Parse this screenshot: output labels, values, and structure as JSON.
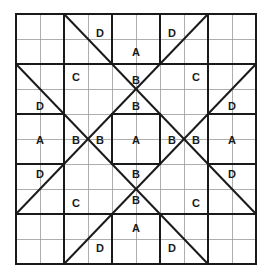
{
  "figure": {
    "name": "quilt-block-diagram",
    "background_color": "#ffffff",
    "grid": {
      "columns": 10,
      "rows": 10,
      "origin_x": 16,
      "origin_y": 14,
      "cell_width": 24,
      "cell_height": 25,
      "thin_line_color": "#9a9a9a",
      "thin_line_width": 0.8,
      "thick_line_color": "#1a1a1a",
      "thick_line_width": 2.0,
      "outer_border_color": "#1a1a1a",
      "outer_border_width": 2.4
    },
    "diagonals": {
      "color": "#1a1a1a",
      "width": 2.0,
      "segments": [
        {
          "name": "diag-top-left-down",
          "x1": 64,
          "y1": 14,
          "x2": 256,
          "y2": 214
        },
        {
          "name": "diag-top-right-down",
          "x1": 208,
          "y1": 14,
          "x2": 16,
          "y2": 214
        },
        {
          "name": "diag-left-top-down",
          "x1": 16,
          "y1": 64,
          "x2": 208,
          "y2": 264
        },
        {
          "name": "diag-right-top-down",
          "x1": 256,
          "y1": 64,
          "x2": 64,
          "y2": 264
        }
      ]
    },
    "thick_rects": [
      {
        "name": "square-top-a",
        "x": 112,
        "y": 14,
        "w": 48,
        "h": 50
      },
      {
        "name": "square-bottom-a",
        "x": 112,
        "y": 214,
        "w": 48,
        "h": 50
      },
      {
        "name": "square-left-a",
        "x": 16,
        "y": 114,
        "w": 48,
        "h": 50
      },
      {
        "name": "square-right-a",
        "x": 208,
        "y": 114,
        "w": 48,
        "h": 50
      },
      {
        "name": "square-center-a",
        "x": 112,
        "y": 114,
        "w": 48,
        "h": 50
      }
    ],
    "thick_lines": [
      {
        "name": "thickline-top-left-horizontal",
        "x1": 16,
        "y1": 64,
        "x2": 112,
        "y2": 64
      },
      {
        "name": "thickline-top-right-horizontal",
        "x1": 160,
        "y1": 64,
        "x2": 256,
        "y2": 64
      },
      {
        "name": "thickline-bottom-left-horizontal",
        "x1": 16,
        "y1": 214,
        "x2": 112,
        "y2": 214
      },
      {
        "name": "thickline-bottom-right-horizontal",
        "x1": 160,
        "y1": 214,
        "x2": 256,
        "y2": 214
      },
      {
        "name": "thickline-left-top-vertical",
        "x1": 64,
        "y1": 14,
        "x2": 64,
        "y2": 114
      },
      {
        "name": "thickline-right-top-vertical",
        "x1": 208,
        "y1": 14,
        "x2": 208,
        "y2": 114
      },
      {
        "name": "thickline-left-bottom-vertical",
        "x1": 64,
        "y1": 164,
        "x2": 64,
        "y2": 264
      },
      {
        "name": "thickline-right-bottom-vertical",
        "x1": 208,
        "y1": 164,
        "x2": 208,
        "y2": 264
      }
    ],
    "labels": [
      {
        "id": "label-d-top-left",
        "text": "D",
        "x": 100,
        "y": 33
      },
      {
        "id": "label-d-top-right",
        "text": "D",
        "x": 172,
        "y": 33
      },
      {
        "id": "label-a-top",
        "text": "A",
        "x": 136,
        "y": 52
      },
      {
        "id": "label-c-upper-left",
        "text": "C",
        "x": 76,
        "y": 77
      },
      {
        "id": "label-b-upper-center",
        "text": "B",
        "x": 136,
        "y": 80
      },
      {
        "id": "label-c-upper-right",
        "text": "C",
        "x": 196,
        "y": 77
      },
      {
        "id": "label-d-left-upper",
        "text": "D",
        "x": 40,
        "y": 106
      },
      {
        "id": "label-b-center-upper",
        "text": "B",
        "x": 136,
        "y": 106
      },
      {
        "id": "label-d-right-upper",
        "text": "D",
        "x": 232,
        "y": 106
      },
      {
        "id": "label-a-left",
        "text": "A",
        "x": 40,
        "y": 140
      },
      {
        "id": "label-b-left-outer",
        "text": "B",
        "x": 76,
        "y": 140
      },
      {
        "id": "label-b-left-inner",
        "text": "B",
        "x": 100,
        "y": 140
      },
      {
        "id": "label-a-center",
        "text": "A",
        "x": 136,
        "y": 140
      },
      {
        "id": "label-b-right-inner",
        "text": "B",
        "x": 172,
        "y": 140
      },
      {
        "id": "label-b-right-outer",
        "text": "B",
        "x": 196,
        "y": 140
      },
      {
        "id": "label-a-right",
        "text": "A",
        "x": 232,
        "y": 140
      },
      {
        "id": "label-d-left-lower",
        "text": "D",
        "x": 40,
        "y": 174
      },
      {
        "id": "label-b-center-lower",
        "text": "B",
        "x": 136,
        "y": 174
      },
      {
        "id": "label-d-right-lower",
        "text": "D",
        "x": 232,
        "y": 174
      },
      {
        "id": "label-c-lower-left",
        "text": "C",
        "x": 76,
        "y": 203
      },
      {
        "id": "label-b-lower-center",
        "text": "B",
        "x": 136,
        "y": 200
      },
      {
        "id": "label-c-lower-right",
        "text": "C",
        "x": 196,
        "y": 203
      },
      {
        "id": "label-a-bottom",
        "text": "A",
        "x": 136,
        "y": 228
      },
      {
        "id": "label-d-bottom-left",
        "text": "D",
        "x": 100,
        "y": 248
      },
      {
        "id": "label-d-bottom-right",
        "text": "D",
        "x": 172,
        "y": 248
      }
    ]
  }
}
